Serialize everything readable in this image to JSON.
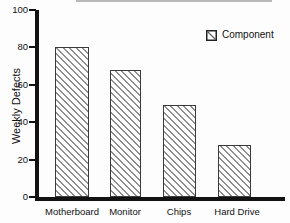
{
  "chart_data": {
    "type": "bar",
    "title": "",
    "categories": [
      "Motherboard",
      "Monitor",
      "Chips",
      "Hard Drive"
    ],
    "values": [
      80,
      68,
      49,
      28
    ],
    "series": [
      {
        "name": "Component",
        "values": [
          80,
          68,
          49,
          28
        ]
      }
    ],
    "xlabel": "",
    "ylabel": "Weekly Defects",
    "ylim": [
      0,
      100
    ],
    "yticks": [
      100,
      80,
      60,
      40,
      20,
      0
    ],
    "grid": false,
    "legend": {
      "position": "top-right",
      "entries": [
        "Component"
      ]
    },
    "bar_style": {
      "hatch": "diagonal-backslash",
      "fill": "#ffffff",
      "hatch_line_color": "#8f8f8f",
      "border_color": "#3a3a3a"
    },
    "colors": {
      "axis": "#121212",
      "text": "#111111",
      "background": "#fdfdfd",
      "cropped_title_strip": "#b9b9b9"
    }
  }
}
